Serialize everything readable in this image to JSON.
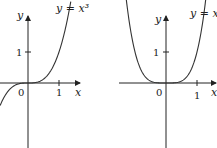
{
  "chart_data": [
    {
      "type": "line",
      "title": "y = x^3",
      "label": "y = x³",
      "xlabel": "x",
      "ylabel": "y",
      "x_ticks": [
        "0",
        "1"
      ],
      "y_ticks": [
        "1"
      ],
      "function": "x^3",
      "x": [
        -1,
        -0.75,
        -0.5,
        -0.25,
        0,
        0.25,
        0.5,
        0.75,
        1,
        1.25
      ],
      "values": [
        -1,
        -0.42,
        -0.125,
        -0.016,
        0,
        0.016,
        0.125,
        0.42,
        1,
        1.95
      ],
      "xlim": [
        -0.95,
        1.4
      ],
      "ylim": [
        -2.0,
        2.2
      ],
      "grid": false
    },
    {
      "type": "line",
      "title": "y = x^4",
      "label": "y = x⁴",
      "xlabel": "x",
      "ylabel": "y",
      "x_ticks": [
        "0",
        "1"
      ],
      "y_ticks": [
        "1"
      ],
      "function": "x^4",
      "x": [
        -1.2,
        -1,
        -0.75,
        -0.5,
        -0.25,
        0,
        0.25,
        0.5,
        0.75,
        1,
        1.2
      ],
      "values": [
        2.07,
        1,
        0.32,
        0.0625,
        0.004,
        0,
        0.004,
        0.0625,
        0.32,
        1,
        2.07
      ],
      "xlim": [
        -1.4,
        1.5
      ],
      "ylim": [
        -2.0,
        2.2
      ],
      "grid": false
    }
  ],
  "left": {
    "title": "y = x³",
    "x_axis": "x",
    "y_axis": "y",
    "origin": "0",
    "x_tick": "1",
    "y_tick": "1"
  },
  "right": {
    "title": "y = x⁴",
    "x_axis": "x",
    "y_axis": "y",
    "origin": "0",
    "x_tick": "1",
    "y_tick": "1"
  }
}
